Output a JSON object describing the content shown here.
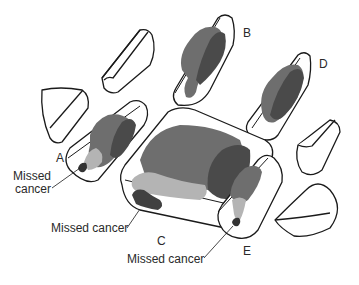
{
  "diagram": {
    "type": "specimen-sectioning-illustration",
    "colors": {
      "outline": "#1a1a1a",
      "block_fill": "#ffffff",
      "tumor_dark": "#4a4a4a",
      "tumor_medium": "#6e6e6e",
      "tumor_light": "#b4b4b4"
    },
    "blocks": [
      {
        "id": "A",
        "label": "A",
        "contains_tumor": true,
        "missed_cancer": true
      },
      {
        "id": "B",
        "label": "B",
        "contains_tumor": true,
        "missed_cancer": false
      },
      {
        "id": "C",
        "label": "C",
        "contains_tumor": true,
        "missed_cancer": true
      },
      {
        "id": "D",
        "label": "D",
        "contains_tumor": true,
        "missed_cancer": false
      },
      {
        "id": "E",
        "label": "E",
        "contains_tumor": true,
        "missed_cancer": true
      }
    ],
    "annotations": [
      {
        "target": "A",
        "text_line1": "Missed",
        "text_line2": "cancer"
      },
      {
        "target": "C",
        "text": "Missed cancer"
      },
      {
        "target": "E",
        "text": "Missed cancer"
      }
    ]
  }
}
